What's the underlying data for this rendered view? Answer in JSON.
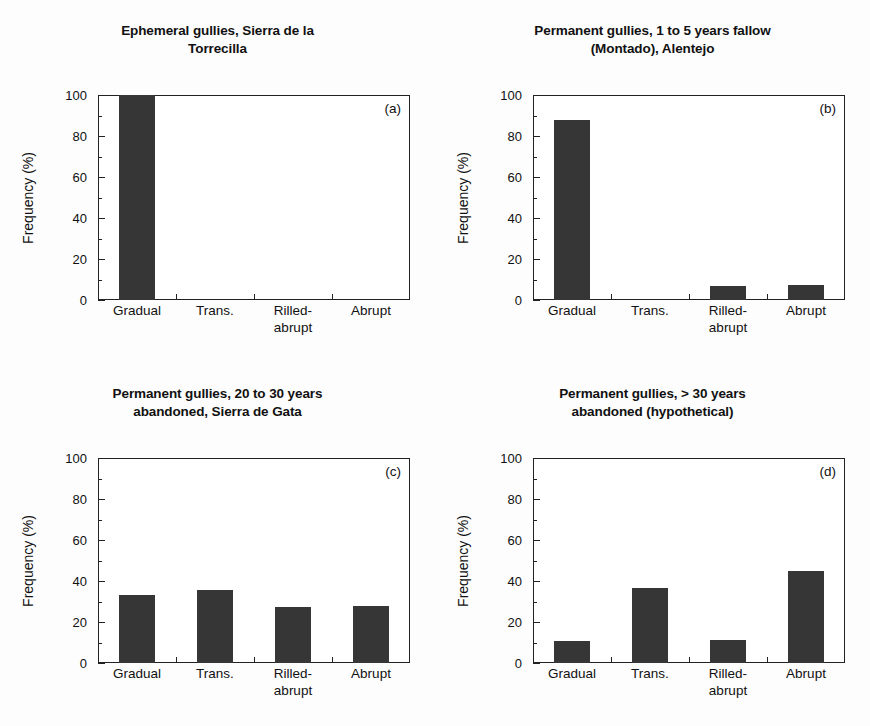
{
  "figure": {
    "axis_label_y": "Frequency (%)",
    "categories": [
      "Gradual",
      "Trans.",
      "Rilled-",
      "Abrupt"
    ],
    "category_full": [
      "Gradual",
      "Trans.",
      "Rilled-abrupt",
      "Abrupt"
    ],
    "category_line2": [
      "",
      "",
      "abrupt",
      ""
    ],
    "yticks": [
      "0",
      "20",
      "40",
      "60",
      "80",
      "100"
    ],
    "bar_color": "#363636",
    "axis_color": "#222222",
    "background": "#fdfdfd"
  },
  "panels": [
    {
      "letter": "(a)",
      "title_line1": "Ephemeral gullies, Sierra de la",
      "title_line2": "Torrecilla"
    },
    {
      "letter": "(b)",
      "title_line1": "Permanent gullies, 1 to 5 years fallow",
      "title_line2": "(Montado), Alentejo"
    },
    {
      "letter": "(c)",
      "title_line1": "Permanent gullies, 20 to 30 years",
      "title_line2": "abandoned, Sierra de Gata"
    },
    {
      "letter": "(d)",
      "title_line1": "Permanent gullies, > 30 years",
      "title_line2": "abandoned (hypothetical)"
    }
  ],
  "chart_data": [
    {
      "type": "bar",
      "title": "Ephemeral gullies, Sierra de la Torrecilla",
      "panel": "(a)",
      "categories": [
        "Gradual",
        "Trans.",
        "Rilled-abrupt",
        "Abrupt"
      ],
      "values": [
        100,
        0,
        0,
        0
      ],
      "xlabel": "",
      "ylabel": "Frequency (%)",
      "ylim": [
        0,
        100
      ],
      "yticks": [
        0,
        20,
        40,
        60,
        80,
        100
      ],
      "grid": false,
      "legend": "none"
    },
    {
      "type": "bar",
      "title": "Permanent gullies, 1 to 5 years fallow (Montado), Alentejo",
      "panel": "(b)",
      "categories": [
        "Gradual",
        "Trans.",
        "Rilled-abrupt",
        "Abrupt"
      ],
      "values": [
        88,
        0,
        7,
        7.5
      ],
      "xlabel": "",
      "ylabel": "Frequency (%)",
      "ylim": [
        0,
        100
      ],
      "yticks": [
        0,
        20,
        40,
        60,
        80,
        100
      ],
      "grid": false,
      "legend": "none"
    },
    {
      "type": "bar",
      "title": "Permanent gullies, 20 to 30 years abandoned, Sierra de Gata",
      "panel": "(c)",
      "categories": [
        "Gradual",
        "Trans.",
        "Rilled-abrupt",
        "Abrupt"
      ],
      "values": [
        33,
        35.5,
        27.5,
        28
      ],
      "xlabel": "",
      "ylabel": "Frequency (%)",
      "ylim": [
        0,
        100
      ],
      "yticks": [
        0,
        20,
        40,
        60,
        80,
        100
      ],
      "grid": false,
      "legend": "none"
    },
    {
      "type": "bar",
      "title": "Permanent gullies, > 30 years abandoned (hypothetical)",
      "panel": "(d)",
      "categories": [
        "Gradual",
        "Trans.",
        "Rilled-abrupt",
        "Abrupt"
      ],
      "values": [
        10.5,
        36.5,
        11,
        45
      ],
      "xlabel": "",
      "ylabel": "Frequency (%)",
      "ylim": [
        0,
        100
      ],
      "yticks": [
        0,
        20,
        40,
        60,
        80,
        100
      ],
      "grid": false,
      "legend": "none"
    }
  ]
}
